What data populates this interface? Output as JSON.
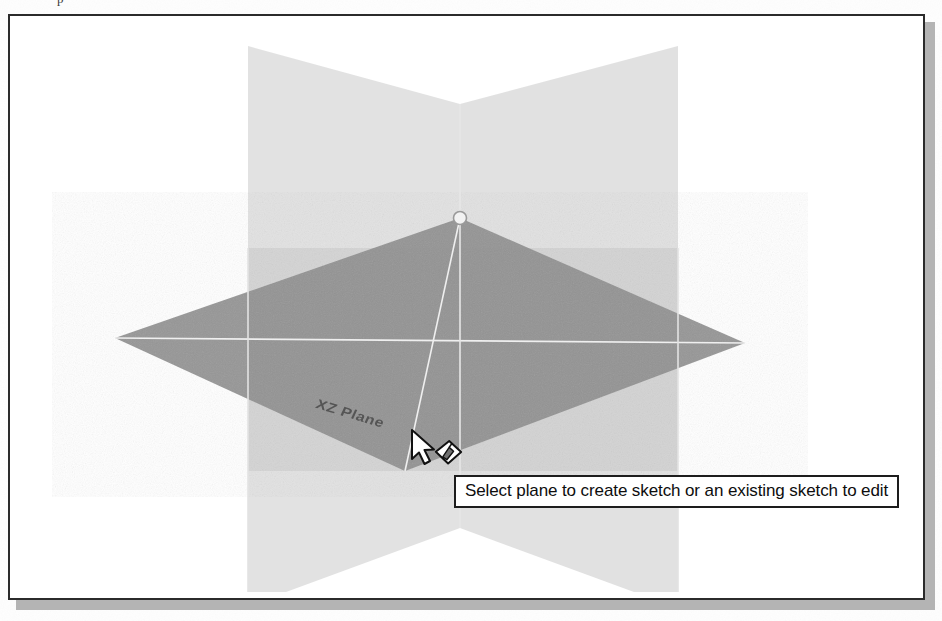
{
  "page": {
    "clipped_text_above": "p",
    "background_color": "#fefefe"
  },
  "viewport": {
    "name": "cad-3d-viewport",
    "background_color": "#ffffff",
    "border_color": "#2b2b2b",
    "shadow_color": "#b4b4b4"
  },
  "scene": {
    "type": "3d-reference-planes",
    "origin": {
      "x": 450,
      "y": 320
    },
    "planes": [
      {
        "id": "yz-plane",
        "label": "YZ Plane",
        "orientation": "vertical",
        "state": "unselected",
        "fill": "#d9d9d9",
        "opacity": 0.75
      },
      {
        "id": "xy-plane",
        "label": "XY Plane",
        "orientation": "vertical",
        "state": "unselected",
        "fill": "#d2d2d2",
        "opacity": 0.75
      },
      {
        "id": "xz-plane",
        "label": "XZ Plane",
        "orientation": "horizontal",
        "state": "highlighted",
        "fill": "#8a8a8a",
        "opacity": 0.9
      }
    ],
    "axis_line_color": "#ededed",
    "origin_marker": {
      "name": "origin-vertex-marker",
      "x": 450,
      "y": 202,
      "radius": 6
    },
    "visible_plane_label": "XZ Plane"
  },
  "cursor": {
    "name": "arrow-cursor-with-sketch-badge",
    "type": "arrow",
    "badge": "create-sketch-icon",
    "x": 405,
    "y": 425
  },
  "tooltip": {
    "name": "plane-selection-tooltip",
    "text": "Select plane to create sketch or an existing sketch to edit",
    "background": "#ffffff",
    "border_color": "#1d1d1d",
    "text_color": "#0d0d0d"
  }
}
